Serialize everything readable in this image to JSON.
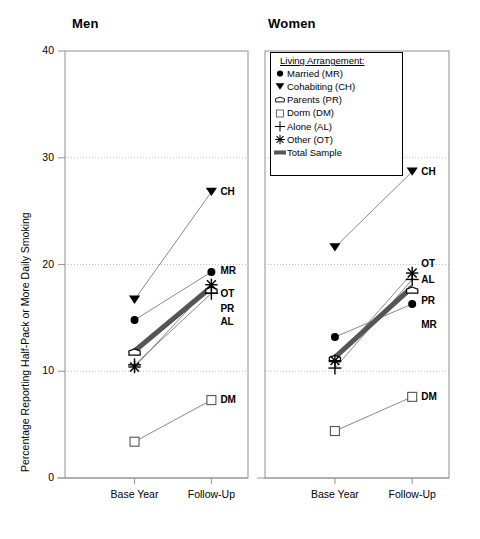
{
  "figure": {
    "ylabel": "Percentage Reporting Half-Pack or More Daily Smoking",
    "panels": [
      {
        "id": "men",
        "title": "Men"
      },
      {
        "id": "women",
        "title": "Women"
      }
    ]
  },
  "legend": {
    "title": "Living Arrangement:",
    "items": [
      {
        "label": "Married (MR)",
        "symbol": "filled-circle",
        "code": "MR"
      },
      {
        "label": "Cohabiting (CH)",
        "symbol": "filled-down-triangle",
        "code": "CH"
      },
      {
        "label": "Parents (PR)",
        "symbol": "open-house-pentagon",
        "code": "PR"
      },
      {
        "label": "Dorm (DM)",
        "symbol": "open-square",
        "code": "DM"
      },
      {
        "label": "Alone (AL)",
        "symbol": "plus-cross",
        "code": "AL"
      },
      {
        "label": "Other (OT)",
        "symbol": "asterisk-star",
        "code": "OT"
      },
      {
        "label": "Total Sample",
        "symbol": "thick-bar",
        "code": "TS"
      }
    ]
  },
  "chart_data": {
    "type": "line",
    "title": "",
    "xlabel": "",
    "ylabel": "Percentage Reporting Half-Pack or More Daily Smoking",
    "categories": [
      "Base Year",
      "Follow-Up"
    ],
    "x_tick_labels": [
      "Base Year",
      "Follow-Up"
    ],
    "y_tick_labels": [
      "0",
      "10",
      "20",
      "30",
      "40"
    ],
    "y_ticks": [
      0,
      10,
      20,
      30,
      40
    ],
    "ylim": [
      0,
      40
    ],
    "grid": "horizontal-dotted-at-10-20-30",
    "legend_position": "top-left-of-right-panel",
    "panels": [
      {
        "name": "Men",
        "series": [
          {
            "name": "Married (MR)",
            "code": "MR",
            "symbol": "filled-circle",
            "values": [
              14.8,
              19.3
            ],
            "end_label": "MR"
          },
          {
            "name": "Cohabiting (CH)",
            "code": "CH",
            "symbol": "filled-down-triangle",
            "values": [
              16.7,
              26.8
            ],
            "end_label": "CH"
          },
          {
            "name": "Parents (PR)",
            "code": "PR",
            "symbol": "open-house-pentagon",
            "values": [
              11.8,
              17.6
            ],
            "end_label": "PR"
          },
          {
            "name": "Dorm (DM)",
            "code": "DM",
            "symbol": "open-square",
            "values": [
              3.4,
              7.3
            ],
            "end_label": "DM"
          },
          {
            "name": "Alone (AL)",
            "code": "AL",
            "symbol": "plus-cross",
            "values": [
              10.6,
              17.3
            ],
            "end_label": "AL"
          },
          {
            "name": "Other (OT)",
            "code": "OT",
            "symbol": "asterisk-star",
            "values": [
              10.4,
              18.1
            ],
            "end_label": "OT"
          },
          {
            "name": "Total Sample",
            "code": "TS",
            "symbol": "thick-bar",
            "values": [
              11.9,
              17.9
            ],
            "end_label": ""
          }
        ]
      },
      {
        "name": "Women",
        "series": [
          {
            "name": "Married (MR)",
            "code": "MR",
            "symbol": "filled-circle",
            "values": [
              13.2,
              16.3
            ],
            "end_label": "MR"
          },
          {
            "name": "Cohabiting (CH)",
            "code": "CH",
            "symbol": "filled-down-triangle",
            "values": [
              21.6,
              28.7
            ],
            "end_label": "CH"
          },
          {
            "name": "Parents (PR)",
            "code": "PR",
            "symbol": "open-house-pentagon",
            "values": [
              11.2,
              17.6
            ],
            "end_label": "PR"
          },
          {
            "name": "Dorm (DM)",
            "code": "DM",
            "symbol": "open-square",
            "values": [
              4.4,
              7.6
            ],
            "end_label": "DM"
          },
          {
            "name": "Alone (AL)",
            "code": "AL",
            "symbol": "plus-cross",
            "values": [
              10.3,
              18.6
            ],
            "end_label": "AL"
          },
          {
            "name": "Other (OT)",
            "code": "OT",
            "symbol": "asterisk-star",
            "values": [
              11.0,
              19.2
            ],
            "end_label": "OT"
          },
          {
            "name": "Total Sample",
            "code": "TS",
            "symbol": "thick-bar",
            "values": [
              11.3,
              17.9
            ],
            "end_label": ""
          }
        ]
      }
    ]
  },
  "colors": {
    "ink": "#000000",
    "line": "#7a7a7a",
    "total_sample": "#555555",
    "axis": "#9a9a9a",
    "grid": "#b5b5b5"
  }
}
